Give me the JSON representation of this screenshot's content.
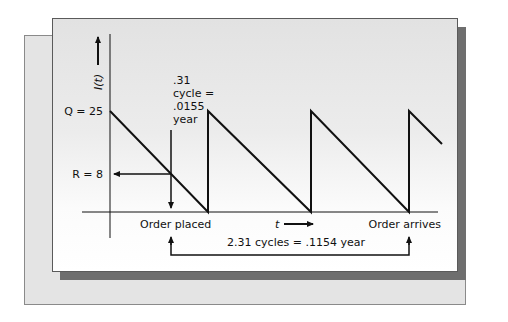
{
  "diagram": {
    "y_axis_label": "I(t)",
    "x_axis_label": "t",
    "q_label": "Q = 25",
    "q_value": 25,
    "r_label": "R = 8",
    "r_value": 8,
    "lead_time_note": [
      ".31",
      "cycle =",
      ".0155",
      "year"
    ],
    "order_placed_label": "Order placed",
    "order_arrives_label": "Order arrives",
    "lead_time_label": "2.31 cycles = .1154 year",
    "cycles_shown": 3.35,
    "colors": {
      "line": "#111111",
      "panel_border": "#5a5a5a",
      "shadow": "#6e6e6e",
      "back_panel": "#e4e4e4"
    }
  }
}
